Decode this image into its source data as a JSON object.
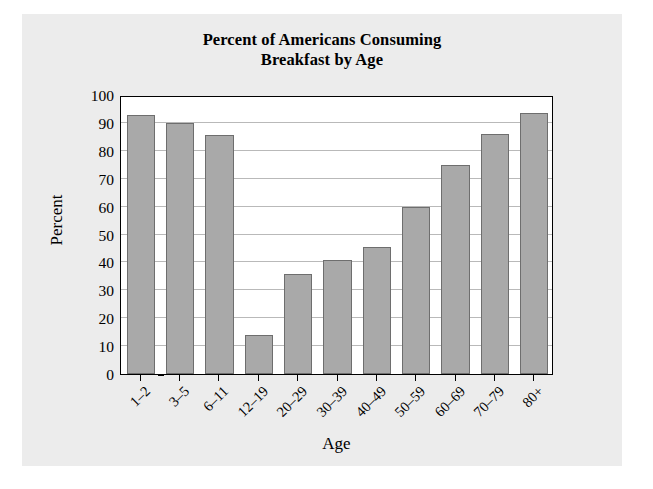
{
  "chart_data": {
    "type": "bar",
    "title": "Percent of Americans Consuming Breakfast by Age",
    "title_line1": "Percent of Americans Consuming",
    "title_line2": "Breakfast by Age",
    "xlabel": "Age",
    "ylabel": "Percent",
    "categories": [
      "1–2",
      "3–5",
      "6–11",
      "12–19",
      "20–29",
      "30–39",
      "40–49",
      "50–59",
      "60–69",
      "70–79",
      "80+"
    ],
    "values": [
      93,
      90,
      85.5,
      14,
      36,
      41,
      45.5,
      60,
      75,
      86,
      93.5
    ],
    "ylim": [
      0,
      100
    ],
    "yticks": [
      0,
      10,
      20,
      30,
      40,
      50,
      60,
      70,
      80,
      90,
      100
    ],
    "ytick_labels": [
      "0",
      "10",
      "20",
      "30",
      "40",
      "50",
      "60",
      "70",
      "80",
      "90",
      "100"
    ],
    "grid": true,
    "legend": null,
    "bar_color": "#a9a9a9",
    "bar_edge_color": "#6e6e6e",
    "plot_background": "#ffffff",
    "figure_background": "#ececec",
    "gridline_color": "#b9b9b9"
  }
}
